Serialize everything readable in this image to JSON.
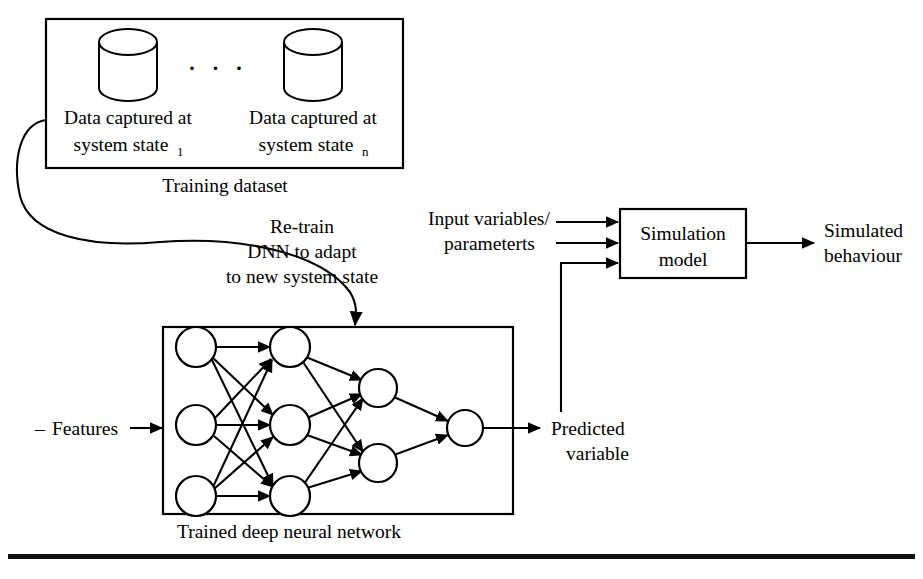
{
  "figure": {
    "background_color": "#ffffff",
    "line_color": "#000000"
  },
  "training_dataset": {
    "caption": "Training dataset",
    "ellipsis": "· · ·",
    "datasets": [
      {
        "line1": "Data captured at",
        "line2": "system state",
        "subscript": "1"
      },
      {
        "line1": "Data captured at",
        "line2": "system state",
        "subscript": "n"
      }
    ]
  },
  "retrain_annotation": {
    "line1": "Re-train",
    "line2": "DNN to adapt",
    "line3": "to new system state"
  },
  "neural_network": {
    "caption": "Trained deep neural network",
    "input_label_dash": "–",
    "input_label": "Features",
    "output_label_line1": "Predicted",
    "output_label_line2": "variable",
    "layers": [
      {
        "name": "input",
        "count": 3
      },
      {
        "name": "hidden-1",
        "count": 3
      },
      {
        "name": "hidden-2",
        "count": 2
      },
      {
        "name": "output",
        "count": 1
      }
    ]
  },
  "simulation": {
    "box_line1": "Simulation",
    "box_line2": "model",
    "input_label_line1": "Input variables/",
    "input_label_line2": "parameterts",
    "output_label_line1": "Simulated",
    "output_label_line2": "behaviour"
  }
}
